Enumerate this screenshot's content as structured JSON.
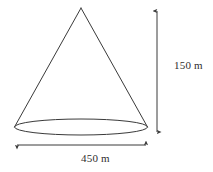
{
  "figure": {
    "kind": "cone-diagram",
    "stroke_color": "#3a3a3a",
    "fill_color": "#ffffff",
    "background_color": "#ffffff"
  },
  "labels": {
    "height": "150 m",
    "diameter": "450 m"
  },
  "measurements": {
    "height_value": 150,
    "height_unit": "m",
    "diameter_value": 450,
    "diameter_unit": "m"
  },
  "geometry": {
    "apex": {
      "x": 81,
      "y": 8
    },
    "base_center": {
      "x": 81,
      "y": 127
    },
    "base_rx": 66.5,
    "base_ry": 8,
    "base_left": {
      "x": 14.5,
      "y": 127
    },
    "base_right": {
      "x": 147.5,
      "y": 127
    },
    "height_dimension_line": {
      "x": 157,
      "y1": 10,
      "y2": 133
    },
    "diameter_dimension_line": {
      "y": 145,
      "x1": 16,
      "x2": 147
    }
  }
}
